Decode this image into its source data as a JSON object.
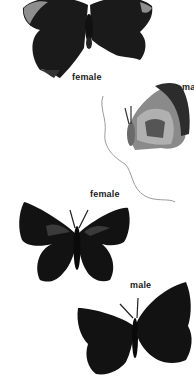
{
  "illustration": {
    "subject": "butterfly species plate",
    "specimens": [
      {
        "id": "top",
        "view": "upperside",
        "color": "dark brown-black with grey-blue band"
      },
      {
        "id": "side",
        "view": "underside profile",
        "color": "grey with dark banding"
      },
      {
        "id": "middle",
        "view": "upperside",
        "color": "black with faint blue patches"
      },
      {
        "id": "bottom",
        "view": "upperside",
        "color": "black"
      }
    ],
    "labels": {
      "top_female": "female",
      "side_male": "ma",
      "middle_female": "female",
      "bottom_male": "male"
    },
    "colors": {
      "background": "#ffffff",
      "wing_dark": "#141414",
      "wing_grey": "#8a8a8a",
      "band": "#9a9a9a"
    }
  }
}
